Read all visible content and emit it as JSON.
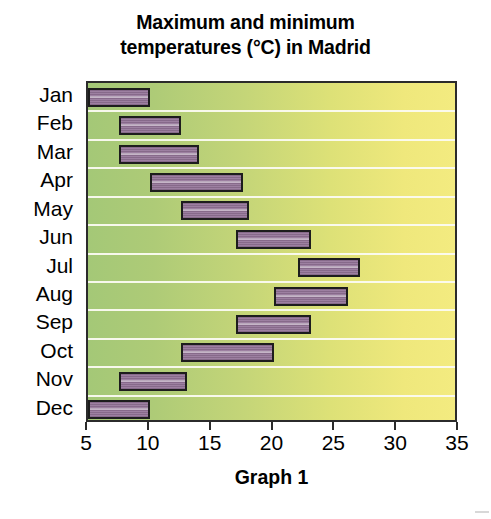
{
  "title": {
    "line1": "Maximum and minimum",
    "line2": "temperatures (°C) in Madrid"
  },
  "caption": "Graph 1",
  "chart_data": {
    "type": "bar",
    "orientation": "horizontal",
    "subtype": "floating-range-bar",
    "title": "Maximum and minimum temperatures (°C) in Madrid",
    "caption": "Graph 1",
    "xlabel": "",
    "ylabel": "",
    "unit": "°C",
    "xlim": [
      5,
      35
    ],
    "xticks": [
      5,
      10,
      15,
      20,
      25,
      30,
      35
    ],
    "xtick_labels": [
      "5",
      "10",
      "15",
      "20",
      "25",
      "30",
      "35"
    ],
    "grid": "horizontal",
    "legend": "none",
    "categories": [
      "Jan",
      "Feb",
      "Mar",
      "Apr",
      "May",
      "Jun",
      "Jul",
      "Aug",
      "Sep",
      "Oct",
      "Nov",
      "Dec"
    ],
    "series": [
      {
        "name": "Minimum temperature",
        "values": [
          5,
          7.5,
          7.5,
          10,
          12.5,
          17,
          22,
          20,
          17,
          12.5,
          7.5,
          5
        ]
      },
      {
        "name": "Maximum temperature",
        "values": [
          10,
          12.5,
          14,
          17.5,
          18,
          23,
          27,
          26,
          23,
          20,
          13,
          10
        ]
      }
    ],
    "bars": [
      {
        "category": "Jan",
        "min": 5,
        "max": 10
      },
      {
        "category": "Feb",
        "min": 7.5,
        "max": 12.5
      },
      {
        "category": "Mar",
        "min": 7.5,
        "max": 14
      },
      {
        "category": "Apr",
        "min": 10,
        "max": 17.5
      },
      {
        "category": "May",
        "min": 12.5,
        "max": 18
      },
      {
        "category": "Jun",
        "min": 17,
        "max": 23
      },
      {
        "category": "Jul",
        "min": 22,
        "max": 27
      },
      {
        "category": "Aug",
        "min": 20,
        "max": 26
      },
      {
        "category": "Sep",
        "min": 17,
        "max": 23
      },
      {
        "category": "Oct",
        "min": 12.5,
        "max": 20
      },
      {
        "category": "Nov",
        "min": 7.5,
        "max": 13
      },
      {
        "category": "Dec",
        "min": 5,
        "max": 10
      }
    ],
    "colors": {
      "bar_fill": "#96769a",
      "bar_border": "#1d1d1d",
      "plot_bg_left": "#a4c877",
      "plot_bg_right": "#f3eb80",
      "gridline": "#fbfbf2",
      "axis": "#2b2b2b",
      "text": "#000000"
    }
  }
}
